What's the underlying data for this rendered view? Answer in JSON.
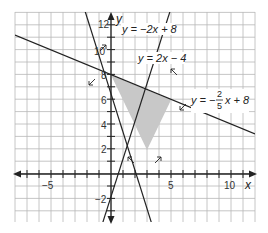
{
  "chart_data": {
    "type": "line",
    "title": "",
    "xlabel": "x",
    "ylabel": "y",
    "xlim": [
      -8,
      12
    ],
    "ylim": [
      -4,
      13
    ],
    "grid": true,
    "x_tick_labels": [
      "-5",
      "5",
      "10"
    ],
    "y_tick_labels": [
      "-2",
      "2",
      "4",
      "6",
      "8",
      "10",
      "12"
    ],
    "series": [
      {
        "name": "y = -2x + 8",
        "slope": -2,
        "intercept": 8
      },
      {
        "name": "y = 2x - 4",
        "slope": 2,
        "intercept": -4
      },
      {
        "name": "y = -2/5 x + 8",
        "slope": -0.4,
        "intercept": 8
      }
    ],
    "shaded_region": {
      "description": "feasible region bounded by the three lines",
      "vertices": [
        [
          0,
          8
        ],
        [
          5,
          6
        ],
        [
          3,
          2
        ]
      ],
      "color": "#c8c8c8"
    },
    "annotations": [
      {
        "text": "y = -2x + 8",
        "position": "upper left near y-axis"
      },
      {
        "text": "y = 2x - 4",
        "position": "upper middle"
      },
      {
        "text": "y = -2/5 x + 8",
        "position": "right"
      }
    ]
  },
  "labels": {
    "line1": "y = −2x + 8",
    "line2": "y = 2x − 4",
    "line3_prefix": "y = −",
    "line3_num": "2",
    "line3_den": "5",
    "line3_suffix": "x + 8",
    "x_axis": "x",
    "y_axis": "y"
  },
  "ticks": {
    "x_neg5": "−5",
    "x_5": "5",
    "x_10": "10",
    "y_neg2": "−2",
    "y_2": "2",
    "y_4": "4",
    "y_6": "6",
    "y_8": "8",
    "y_10": "10",
    "y_12": "12"
  }
}
